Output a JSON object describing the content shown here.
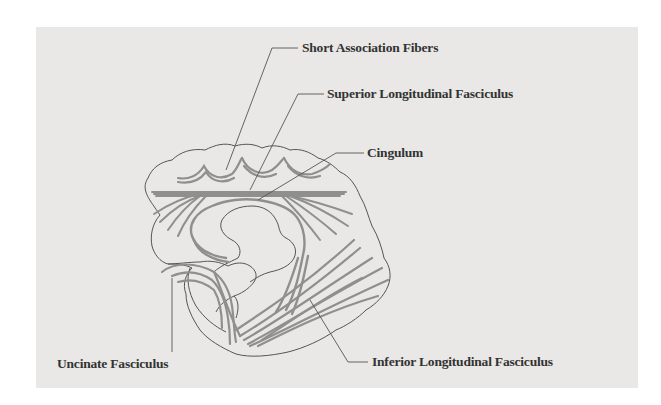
{
  "diagram": {
    "type": "anatomical-illustration",
    "colors": {
      "background": "#e9e8e6",
      "outline": "#555555",
      "fibers": "#8f8f8f",
      "label_text": "#333333"
    },
    "labels": {
      "short_association_fibers": "Short Association Fibers",
      "superior_longitudinal_fasciculus": "Superior Longitudinal Fasciculus",
      "cingulum": "Cingulum",
      "uncinate_fasciculus": "Uncinate Fasciculus",
      "inferior_longitudinal_fasciculus": "Inferior Longitudinal Fasciculus"
    }
  }
}
